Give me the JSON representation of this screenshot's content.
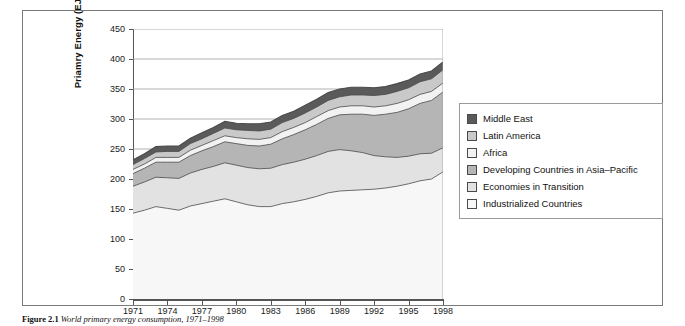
{
  "figure": {
    "caption_label": "Figure 2.1",
    "caption_text": "World primary energy consumption, 1971–1998"
  },
  "axes": {
    "y_title": "Priamry Energy (EJ)",
    "y_ticks": [
      0,
      50,
      100,
      150,
      200,
      250,
      300,
      350,
      400,
      450
    ],
    "x_ticks": [
      "1971",
      "1974",
      "1977",
      "1980",
      "1983",
      "1986",
      "1989",
      "1992",
      "1995",
      "1998"
    ]
  },
  "legend": {
    "items": [
      {
        "label": "Middle East",
        "color": "#5a5a5a"
      },
      {
        "label": "Latin America",
        "color": "#c9c9c9"
      },
      {
        "label": "Africa",
        "color": "#f2f2f2"
      },
      {
        "label": "Developing Countries in Asia–Pacific",
        "color": "#b5b5b5"
      },
      {
        "label": "Economies in Transition",
        "color": "#e2e2e2"
      },
      {
        "label": "Industrialized Countries",
        "color": "#f7f7f7"
      }
    ]
  },
  "chart_data": {
    "type": "area",
    "stacked": true,
    "title": "World primary energy consumption, 1971–1998",
    "xlabel": "",
    "ylabel": "Priamry Energy (EJ)",
    "ylim": [
      0,
      450
    ],
    "grid": true,
    "legend_position": "right",
    "x": [
      1971,
      1972,
      1973,
      1974,
      1975,
      1976,
      1977,
      1978,
      1979,
      1980,
      1981,
      1982,
      1983,
      1984,
      1985,
      1986,
      1987,
      1988,
      1989,
      1990,
      1991,
      1992,
      1993,
      1994,
      1995,
      1996,
      1997,
      1998
    ],
    "series": [
      {
        "name": "Industrialized Countries",
        "color": "#f7f7f7",
        "values": [
          143,
          148,
          154,
          151,
          148,
          155,
          159,
          163,
          167,
          162,
          157,
          154,
          154,
          159,
          162,
          166,
          171,
          177,
          180,
          181,
          182,
          183,
          185,
          188,
          192,
          197,
          200,
          212
        ]
      },
      {
        "name": "Economies in Transition",
        "color": "#e2e2e2",
        "values": [
          45,
          47,
          49,
          51,
          53,
          55,
          57,
          58,
          60,
          61,
          62,
          63,
          64,
          65,
          66,
          67,
          68,
          69,
          69,
          66,
          62,
          56,
          52,
          48,
          46,
          45,
          43,
          40
        ]
      },
      {
        "name": "Developing Countries in Asia–Pacific",
        "color": "#b5b5b5",
        "values": [
          21,
          23,
          25,
          26,
          27,
          29,
          31,
          33,
          35,
          36,
          37,
          38,
          40,
          43,
          46,
          49,
          52,
          55,
          58,
          61,
          64,
          67,
          71,
          75,
          79,
          84,
          88,
          93
        ]
      },
      {
        "name": "Africa",
        "color": "#f2f2f2",
        "values": [
          7,
          7,
          8,
          8,
          8,
          9,
          9,
          10,
          10,
          10,
          11,
          11,
          11,
          12,
          12,
          12,
          13,
          13,
          13,
          14,
          14,
          14,
          14,
          15,
          15,
          15,
          15,
          15
        ]
      },
      {
        "name": "Latin America",
        "color": "#c9c9c9",
        "values": [
          8,
          9,
          9,
          10,
          10,
          11,
          11,
          12,
          13,
          13,
          14,
          14,
          14,
          15,
          15,
          16,
          16,
          17,
          17,
          18,
          18,
          19,
          19,
          20,
          20,
          21,
          21,
          22
        ]
      },
      {
        "name": "Middle East",
        "color": "#5a5a5a",
        "values": [
          8,
          8,
          9,
          9,
          9,
          9,
          10,
          10,
          11,
          11,
          11,
          12,
          12,
          12,
          12,
          13,
          13,
          13,
          13,
          13,
          13,
          13,
          13,
          13,
          13,
          13,
          13,
          13
        ]
      }
    ],
    "totals": [
      232,
      242,
      254,
      255,
      255,
      268,
      277,
      286,
      296,
      293,
      292,
      292,
      295,
      306,
      313,
      323,
      333,
      344,
      350,
      353,
      353,
      352,
      354,
      359,
      365,
      375,
      380,
      395
    ]
  }
}
